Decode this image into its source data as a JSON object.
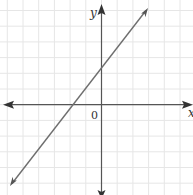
{
  "chart_data": {
    "type": "line",
    "title": "",
    "xlabel": "x",
    "ylabel": "y",
    "origin_label": "0",
    "grid": true,
    "legend": null,
    "xlim": [
      -6.4,
      5.9
    ],
    "ylim": [
      -5.7,
      6.7
    ],
    "series": [
      {
        "name": "line",
        "x": [
          -5.8,
          -1.8,
          0,
          2.9
        ],
        "y": [
          -5.1,
          0,
          2.3,
          6.1
        ],
        "x_intercept": -1.8,
        "y_intercept": 2.3,
        "slope": 1.3
      }
    ]
  },
  "colors": {
    "background": "#ffffff",
    "grid": "#e6e6e6",
    "axis": "#555555",
    "line": "#6e6e6e",
    "text": "#333333"
  }
}
